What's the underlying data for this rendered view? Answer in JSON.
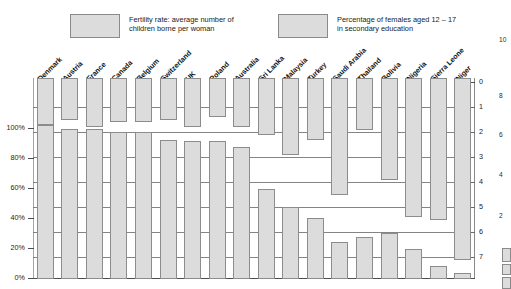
{
  "legend": {
    "fertility": {
      "label": "Fertility rate: average number of\nchildren borne per woman",
      "swatch_color": "#dcdcdc"
    },
    "education": {
      "label": "Percentage of females aged 12 – 17\nin secondary education",
      "swatch_color": "#dcdcdc"
    }
  },
  "axes": {
    "left": {
      "title": "",
      "ticks": [
        "100%",
        "80%",
        "60%",
        "40%",
        "20%",
        "0%"
      ],
      "values": [
        100,
        80,
        60,
        40,
        20,
        0
      ]
    },
    "right": {
      "title": "",
      "ticks": [
        "0",
        "1",
        "2",
        "3",
        "4",
        "5",
        "6",
        "7"
      ],
      "values": [
        0,
        1,
        2,
        3,
        4,
        5,
        6,
        7
      ]
    }
  },
  "neighbour_chart": {
    "ticks": [
      "10",
      "8",
      "6",
      "4",
      "2"
    ]
  },
  "chart_data": {
    "type": "bar",
    "title": "",
    "subtitle": "",
    "xlabel": "",
    "ylabel": "Percentage of females aged 12 – 17 in secondary education",
    "y2label": "Fertility rate: average number of children borne per woman",
    "ylim": [
      0,
      100
    ],
    "y2lim": [
      0,
      8
    ],
    "y2_inverted": true,
    "grid": true,
    "legend_position": "top",
    "categories": [
      "Denmark",
      "Austria",
      "France",
      "Canada",
      "Belgium",
      "Switzerland",
      "UK",
      "Poland",
      "Australia",
      "Sri Lanka",
      "Malaysia",
      "Turkey",
      "Saudi Arabia",
      "Thailand",
      "Bolivia",
      "Nigeria",
      "Sierra Leone",
      "Niger"
    ],
    "series": [
      {
        "name": "Fertility rate: average number of children borne per woman",
        "unit": "children per woman",
        "axis": "right",
        "values": [
          1.7,
          1.5,
          1.8,
          1.6,
          1.6,
          1.5,
          1.8,
          1.4,
          1.8,
          2.1,
          2.9,
          2.3,
          4.5,
          1.9,
          3.9,
          5.4,
          5.5,
          7.1
        ]
      },
      {
        "name": "Percentage of females aged 12 – 17 in secondary education",
        "unit": "%",
        "axis": "left",
        "values": [
          103,
          100,
          100,
          98,
          98,
          93,
          92,
          92,
          88,
          60,
          48,
          41,
          25,
          28,
          31,
          20,
          9,
          4
        ]
      }
    ]
  }
}
